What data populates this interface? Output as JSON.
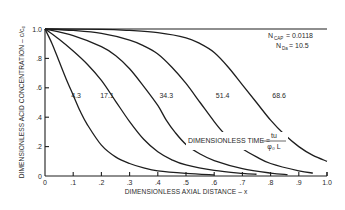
{
  "chart_data": {
    "type": "line",
    "title": "",
    "xlabel": "DIMENSIONLESS AXIAL DISTANCE – x",
    "ylabel": "DIMENSIONLESS ACID CONCENTRATION – c/c₀",
    "xlim": [
      0,
      1.0
    ],
    "ylim": [
      0,
      1.0
    ],
    "grid": false,
    "x_ticks": [
      {
        "value": 0,
        "label": "0"
      },
      {
        "value": 0.1,
        "label": ".1"
      },
      {
        "value": 0.2,
        "label": ".2"
      },
      {
        "value": 0.3,
        "label": ".3"
      },
      {
        "value": 0.4,
        "label": ".4"
      },
      {
        "value": 0.5,
        "label": ".5"
      },
      {
        "value": 0.6,
        "label": ".6"
      },
      {
        "value": 0.7,
        "label": ".7"
      },
      {
        "value": 0.8,
        "label": ".8"
      },
      {
        "value": 0.9,
        "label": ".9"
      },
      {
        "value": 1.0,
        "label": "1.0"
      }
    ],
    "y_ticks": [
      {
        "value": 0,
        "label": "0"
      },
      {
        "value": 0.2,
        "label": ".2"
      },
      {
        "value": 0.4,
        "label": ".4"
      },
      {
        "value": 0.6,
        "label": ".6"
      },
      {
        "value": 0.8,
        "label": ".8"
      },
      {
        "value": 1.0,
        "label": "1.0"
      }
    ],
    "series": [
      {
        "name": "4.3",
        "label_at": [
          0.11,
          0.53
        ],
        "points": [
          [
            0,
            1
          ],
          [
            0.025,
            0.9
          ],
          [
            0.05,
            0.78
          ],
          [
            0.075,
            0.66
          ],
          [
            0.1,
            0.55
          ],
          [
            0.125,
            0.44
          ],
          [
            0.15,
            0.35
          ],
          [
            0.2,
            0.21
          ],
          [
            0.25,
            0.13
          ],
          [
            0.3,
            0.085
          ],
          [
            0.35,
            0.055
          ],
          [
            0.4,
            0.035
          ],
          [
            0.5,
            0.018
          ],
          [
            0.6,
            0.008
          ]
        ]
      },
      {
        "name": "17.1",
        "label_at": [
          0.22,
          0.53
        ],
        "points": [
          [
            0,
            1
          ],
          [
            0.05,
            0.93
          ],
          [
            0.1,
            0.85
          ],
          [
            0.15,
            0.76
          ],
          [
            0.2,
            0.65
          ],
          [
            0.25,
            0.51
          ],
          [
            0.3,
            0.37
          ],
          [
            0.35,
            0.25
          ],
          [
            0.4,
            0.165
          ],
          [
            0.45,
            0.11
          ],
          [
            0.5,
            0.075
          ],
          [
            0.6,
            0.038
          ],
          [
            0.7,
            0.018
          ],
          [
            0.75,
            0.012
          ]
        ]
      },
      {
        "name": "34.3",
        "label_at": [
          0.43,
          0.53
        ],
        "points": [
          [
            0,
            1
          ],
          [
            0.1,
            0.955
          ],
          [
            0.2,
            0.88
          ],
          [
            0.25,
            0.82
          ],
          [
            0.3,
            0.73
          ],
          [
            0.35,
            0.61
          ],
          [
            0.4,
            0.48
          ],
          [
            0.43,
            0.38
          ],
          [
            0.46,
            0.3
          ],
          [
            0.5,
            0.215
          ],
          [
            0.55,
            0.15
          ],
          [
            0.6,
            0.105
          ],
          [
            0.7,
            0.05
          ],
          [
            0.8,
            0.02
          ],
          [
            0.86,
            0.01
          ]
        ]
      },
      {
        "name": "51.4",
        "label_at": [
          0.63,
          0.53
        ],
        "points": [
          [
            0,
            1
          ],
          [
            0.1,
            0.99
          ],
          [
            0.2,
            0.97
          ],
          [
            0.3,
            0.925
          ],
          [
            0.35,
            0.885
          ],
          [
            0.4,
            0.83
          ],
          [
            0.45,
            0.74
          ],
          [
            0.5,
            0.63
          ],
          [
            0.55,
            0.5
          ],
          [
            0.6,
            0.37
          ],
          [
            0.63,
            0.3
          ],
          [
            0.66,
            0.245
          ],
          [
            0.7,
            0.185
          ],
          [
            0.75,
            0.13
          ],
          [
            0.8,
            0.085
          ],
          [
            0.9,
            0.035
          ],
          [
            0.95,
            0.02
          ]
        ]
      },
      {
        "name": "68.6",
        "label_at": [
          0.83,
          0.53
        ],
        "points": [
          [
            0,
            1
          ],
          [
            0.2,
            0.998
          ],
          [
            0.3,
            0.99
          ],
          [
            0.4,
            0.975
          ],
          [
            0.5,
            0.94
          ],
          [
            0.55,
            0.9
          ],
          [
            0.6,
            0.84
          ],
          [
            0.65,
            0.74
          ],
          [
            0.7,
            0.62
          ],
          [
            0.75,
            0.5
          ],
          [
            0.8,
            0.38
          ],
          [
            0.85,
            0.28
          ],
          [
            0.9,
            0.2
          ],
          [
            0.95,
            0.14
          ],
          [
            1.0,
            0.1
          ]
        ]
      }
    ],
    "annotations": {
      "n_cap": {
        "label": "N",
        "sub": "CAP",
        "value": "= 0.0118"
      },
      "n_da": {
        "label": "N",
        "sub": "Da",
        "value": "= 10.5"
      },
      "time_label": "DIMENSIONLESS TIME =",
      "time_numerator": "tu",
      "time_denominator": "φ₀ L"
    }
  }
}
